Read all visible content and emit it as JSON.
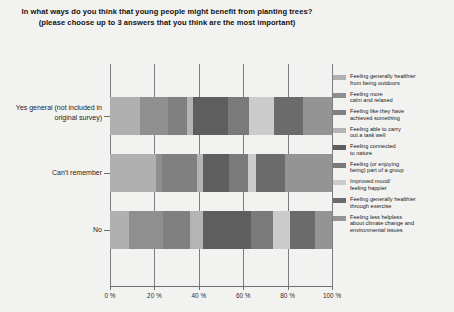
{
  "chart_data": {
    "type": "bar",
    "orientation": "horizontal",
    "stacked": true,
    "normalized": "100%",
    "title": "In what ways do you think that young people might benefit from planting trees? (please choose up to 3 answers that you think are the most important)",
    "xlabel": "",
    "ylabel": "",
    "xlim": [
      0,
      100
    ],
    "xticks": [
      "0 %",
      "20 %",
      "40 %",
      "60 %",
      "80 %",
      "100 %"
    ],
    "xtick_values": [
      0,
      20,
      40,
      60,
      80,
      100
    ],
    "grid": true,
    "legend_position": "right",
    "categories": [
      "Yes general (not included in original survey)",
      "Can't remember",
      "No"
    ],
    "series": [
      {
        "name": "Feeling generally healthier\nfrom being outdoors",
        "color": "#b0b0b0",
        "values": [
          13.5,
          20.5,
          8.5
        ]
      },
      {
        "name": "Feeling more\ncalm and relaxed",
        "color": "#8f8f8f",
        "values": [
          12.5,
          3.0,
          15.5
        ]
      },
      {
        "name": "Feeling like they have\nachieved something",
        "color": "#808080",
        "values": [
          8.5,
          15.5,
          12.0
        ]
      },
      {
        "name": "Feeling able to carry\nout a task well",
        "color": "#b4b4b4",
        "values": [
          3.0,
          3.0,
          6.0
        ]
      },
      {
        "name": "Feeling connected\nto nature",
        "color": "#5e5e5e",
        "values": [
          15.5,
          11.5,
          21.5
        ]
      },
      {
        "name": "Feeling (or enjoying\nbeing) part of a group",
        "color": "#7a7a7a",
        "values": [
          9.5,
          8.5,
          10.0
        ]
      },
      {
        "name": "Improved mood/\nfeeling happier",
        "color": "#cbcbcb",
        "values": [
          11.5,
          4.0,
          7.5
        ]
      },
      {
        "name": "Feeling generally healthier\nthrough exercise",
        "color": "#6b6b6b",
        "values": [
          13.0,
          13.0,
          11.5
        ]
      },
      {
        "name": "Feeling less helpless\nabout climate change and\nenvironmental issues",
        "color": "#949494",
        "values": [
          13.0,
          21.0,
          7.5
        ]
      }
    ]
  },
  "axis": {
    "tick_color": "#6e6e6e",
    "grid_color": "#7d7d7d"
  }
}
